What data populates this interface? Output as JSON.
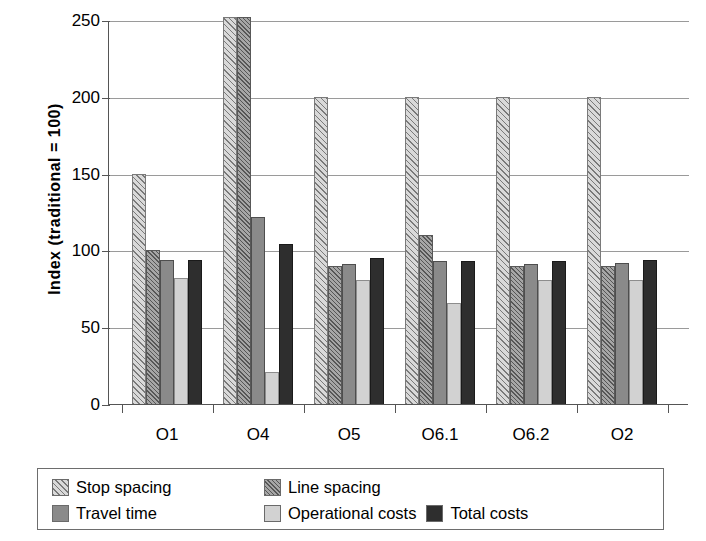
{
  "chart_data": {
    "type": "bar",
    "title": "",
    "subtitle": "",
    "xlabel": "",
    "ylabel": "Index (traditional = 100)",
    "categories": [
      "O1",
      "O4",
      "O5",
      "O6.1",
      "O6.2",
      "O2"
    ],
    "series": [
      {
        "name": "Stop spacing",
        "values": [
          150,
          252,
          200,
          200,
          200,
          200
        ]
      },
      {
        "name": "Line spacing",
        "values": [
          100,
          252,
          90,
          110,
          90,
          90
        ]
      },
      {
        "name": "Travel time",
        "values": [
          94,
          122,
          91,
          93,
          91,
          92
        ]
      },
      {
        "name": "Operational costs",
        "values": [
          82,
          21,
          81,
          66,
          81,
          81
        ]
      },
      {
        "name": "Total costs",
        "values": [
          94,
          104,
          95,
          93,
          93,
          94
        ]
      }
    ],
    "ylim": [
      0,
      250
    ],
    "yticks": [
      0,
      50,
      100,
      150,
      200,
      250
    ],
    "ytick_labels": [
      "0",
      "50",
      "100",
      "150",
      "200",
      "250"
    ],
    "grid": true,
    "grid_axis": "y",
    "legend_position": "bottom",
    "clipped_note": "Stop spacing and Line spacing bars for O4 exceed the 250 axis maximum",
    "colors": {
      "stop_spacing": "#d9d9d9",
      "line_spacing": "#a6a6a6",
      "travel_time": "#8a8a8a",
      "operational_costs": "#d2d2d2",
      "total_costs": "#2e2e2e",
      "axis": "#555555",
      "gridline": "#9a9a9a",
      "background": "#ffffff"
    }
  },
  "axis": {
    "y_title": "Index (traditional = 100)",
    "y_labels": [
      "250",
      "200",
      "150",
      "100",
      "50",
      "0"
    ],
    "x_labels": [
      "O1",
      "O4",
      "O5",
      "O6.1",
      "O6.2",
      "O2"
    ]
  },
  "legend": {
    "row1": [
      {
        "label": "Stop spacing",
        "swatch": "stop-spacing-swatch"
      },
      {
        "label": "Line spacing",
        "swatch": "line-spacing-swatch"
      }
    ],
    "row2": [
      {
        "label": "Travel time",
        "swatch": "travel-time-swatch"
      },
      {
        "label": "Operational costs",
        "swatch": "operational-costs-swatch"
      },
      {
        "label": "Total costs",
        "swatch": "total-costs-swatch"
      }
    ]
  }
}
